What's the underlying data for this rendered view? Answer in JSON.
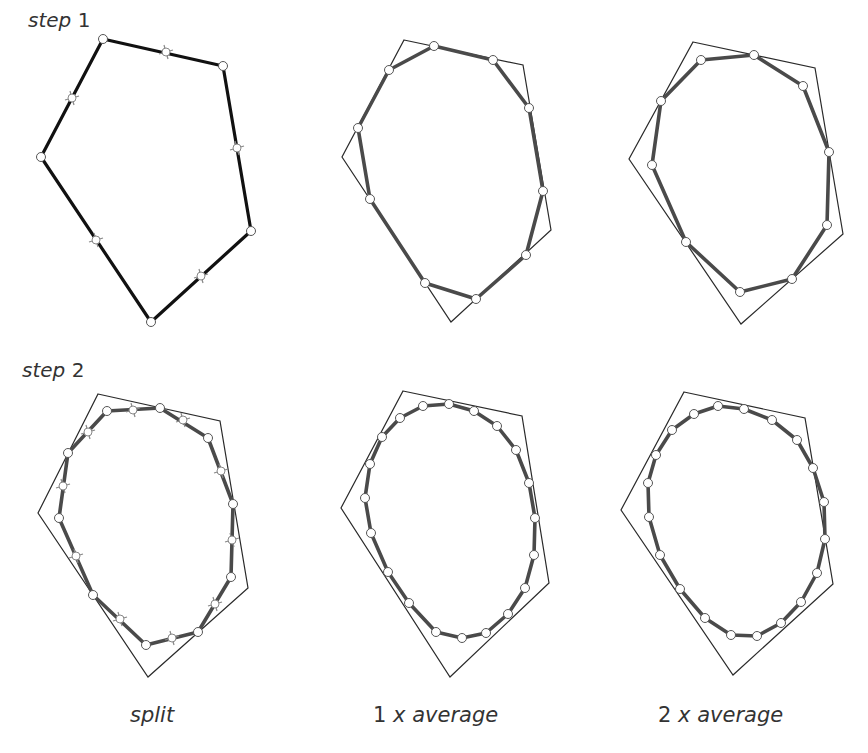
{
  "rows": [
    {
      "label_word": "step",
      "label_num": "1"
    },
    {
      "label_word": "step",
      "label_num": "2"
    }
  ],
  "captions": [
    {
      "num": "",
      "text": "split"
    },
    {
      "num": "1",
      "text": "x average"
    },
    {
      "num": "2",
      "text": "x average"
    }
  ],
  "chart_data": {
    "type": "diagram",
    "rows": [
      "step 1",
      "step 2"
    ],
    "columns": [
      "split",
      "1 x average",
      "2 x average"
    ],
    "panels": [
      {
        "row": 1,
        "col": "split",
        "outer": [
          [
            103,
            39
          ],
          [
            223,
            66
          ],
          [
            251,
            231
          ],
          [
            151,
            322
          ],
          [
            41,
            157
          ]
        ],
        "midpoints": [
          [
            166,
            52
          ],
          [
            237,
            148
          ],
          [
            201,
            276
          ],
          [
            96,
            240
          ],
          [
            72,
            98
          ]
        ]
      },
      {
        "row": 1,
        "col": "1 x average",
        "outer": [
          [
            404,
            40
          ],
          [
            523,
            65
          ],
          [
            551,
            230
          ],
          [
            451,
            322
          ],
          [
            342,
            157
          ]
        ],
        "inner": [
          [
            434,
            46
          ],
          [
            493,
            60
          ],
          [
            529,
            108
          ],
          [
            543,
            191
          ],
          [
            526,
            255
          ],
          [
            476,
            299
          ],
          [
            425,
            283
          ],
          [
            370,
            199
          ],
          [
            358,
            128
          ],
          [
            389,
            70
          ]
        ]
      },
      {
        "row": 1,
        "col": "2 x average",
        "outer": [
          [
            693,
            42
          ],
          [
            815,
            68
          ],
          [
            843,
            234
          ],
          [
            741,
            324
          ],
          [
            629,
            159
          ]
        ],
        "inner": [
          [
            754,
            55
          ],
          [
            803,
            86
          ],
          [
            829,
            152
          ],
          [
            827,
            225
          ],
          [
            792,
            279
          ],
          [
            740,
            292
          ],
          [
            686,
            242
          ],
          [
            652,
            165
          ],
          [
            661,
            101
          ],
          [
            701,
            60
          ]
        ]
      },
      {
        "row": 2,
        "col": "split",
        "outer": [
          [
            98,
            394
          ],
          [
            220,
            421
          ],
          [
            248,
            588
          ],
          [
            148,
            677
          ],
          [
            38,
            513
          ]
        ],
        "inner": [
          [
            107,
            411
          ],
          [
            160,
            408
          ],
          [
            208,
            438
          ],
          [
            233,
            504
          ],
          [
            231,
            577
          ],
          [
            198,
            632
          ],
          [
            146,
            645
          ],
          [
            93,
            595
          ],
          [
            59,
            518
          ],
          [
            68,
            453
          ]
        ],
        "midpoints": [
          [
            133,
            410
          ],
          [
            183,
            420
          ],
          [
            221,
            471
          ],
          [
            232,
            540
          ],
          [
            215,
            604
          ],
          [
            172,
            638
          ],
          [
            120,
            619
          ],
          [
            76,
            556
          ],
          [
            63,
            486
          ],
          [
            88,
            432
          ]
        ]
      },
      {
        "row": 2,
        "col": "1 x average",
        "outer": [
          [
            403,
            391
          ],
          [
            522,
            416
          ],
          [
            549,
            583
          ],
          [
            450,
            677
          ],
          [
            341,
            508
          ]
        ],
        "inner": [
          [
            449,
            404
          ],
          [
            474,
            411
          ],
          [
            497,
            426
          ],
          [
            516,
            450
          ],
          [
            529,
            483
          ],
          [
            535,
            518
          ],
          [
            534,
            555
          ],
          [
            525,
            588
          ],
          [
            508,
            614
          ],
          [
            486,
            633
          ],
          [
            462,
            638
          ],
          [
            436,
            632
          ],
          [
            409,
            603
          ],
          [
            388,
            572
          ],
          [
            371,
            533
          ],
          [
            365,
            498
          ],
          [
            370,
            464
          ],
          [
            382,
            437
          ],
          [
            400,
            418
          ],
          [
            423,
            406
          ]
        ]
      },
      {
        "row": 2,
        "col": "2 x average",
        "outer": [
          [
            684,
            392
          ],
          [
            805,
            418
          ],
          [
            833,
            584
          ],
          [
            733,
            675
          ],
          [
            621,
            510
          ]
        ],
        "inner": [
          [
            744,
            409
          ],
          [
            772,
            420
          ],
          [
            797,
            440
          ],
          [
            813,
            468
          ],
          [
            824,
            502
          ],
          [
            825,
            539
          ],
          [
            817,
            573
          ],
          [
            801,
            602
          ],
          [
            781,
            623
          ],
          [
            757,
            636
          ],
          [
            731,
            635
          ],
          [
            705,
            618
          ],
          [
            680,
            589
          ],
          [
            660,
            555
          ],
          [
            649,
            517
          ],
          [
            648,
            483
          ],
          [
            656,
            455
          ],
          [
            672,
            430
          ],
          [
            694,
            414
          ],
          [
            718,
            406
          ]
        ]
      }
    ]
  }
}
